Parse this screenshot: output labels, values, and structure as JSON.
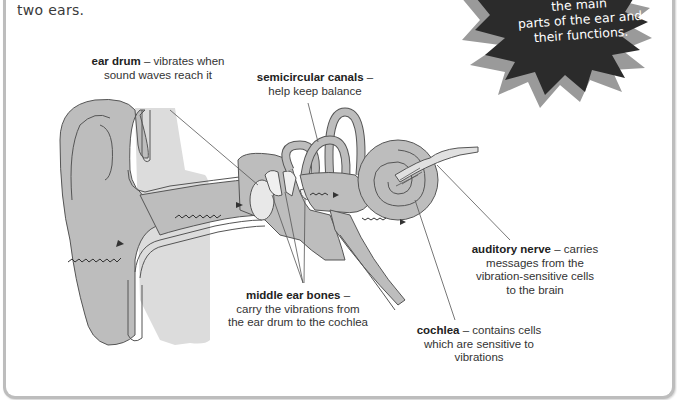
{
  "intro_text": "two ears.",
  "burst": {
    "line1": "the main",
    "line2": "parts of the ear and",
    "line3": "their functions.",
    "fill": "#2b2b2b",
    "shadow": "#9a9a9a"
  },
  "labels": {
    "ear_drum": {
      "term": "ear drum",
      "desc_1": " – vibrates when",
      "desc_2": "sound waves reach it"
    },
    "semicircular_canals": {
      "term": "semicircular canals",
      "desc_1": " –",
      "desc_2": "help keep balance"
    },
    "auditory_nerve": {
      "term": "auditory nerve",
      "desc_1": " – carries",
      "desc_2": "messages from the",
      "desc_3": "vibration-sensitive cells",
      "desc_4": "to the brain"
    },
    "middle_ear_bones": {
      "term": "middle ear bones",
      "desc_1": " –",
      "desc_2": "carry the vibrations from",
      "desc_3": "the ear drum to the cochlea"
    },
    "cochlea": {
      "term": "cochlea",
      "desc_1": " – contains cells",
      "desc_2": "which are sensitive to",
      "desc_3": "vibrations"
    }
  },
  "colors": {
    "tissue": "#bdbdbd",
    "shadow_region": "#dcdcdc",
    "outline": "#555555",
    "text": "#333333"
  }
}
